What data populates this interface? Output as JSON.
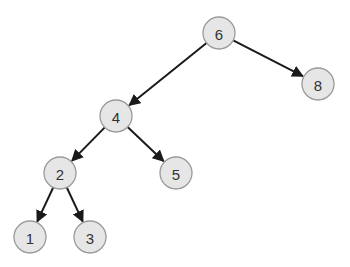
{
  "diagram": {
    "type": "binary-tree",
    "radius": 16,
    "colors": {
      "node_fill": "#e6e6e6",
      "node_stroke": "#9a9a9a",
      "edge": "#1a1a1a",
      "text": "#333333"
    },
    "nodes": [
      {
        "id": "n6",
        "label": "6",
        "x": 219,
        "y": 33
      },
      {
        "id": "n4",
        "label": "4",
        "x": 116,
        "y": 116
      },
      {
        "id": "n8",
        "label": "8",
        "x": 318,
        "y": 84
      },
      {
        "id": "n2",
        "label": "2",
        "x": 60,
        "y": 173
      },
      {
        "id": "n5",
        "label": "5",
        "x": 176,
        "y": 173
      },
      {
        "id": "n1",
        "label": "1",
        "x": 30,
        "y": 237
      },
      {
        "id": "n3",
        "label": "3",
        "x": 90,
        "y": 237
      }
    ],
    "edges": [
      {
        "from": "n6",
        "to": "n4"
      },
      {
        "from": "n6",
        "to": "n8"
      },
      {
        "from": "n4",
        "to": "n2"
      },
      {
        "from": "n4",
        "to": "n5"
      },
      {
        "from": "n2",
        "to": "n1"
      },
      {
        "from": "n2",
        "to": "n3"
      }
    ]
  }
}
